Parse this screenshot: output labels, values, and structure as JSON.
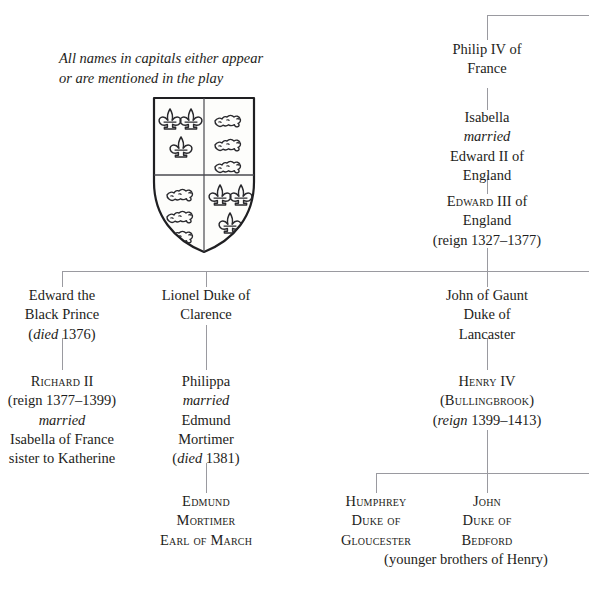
{
  "caption": {
    "line1": "All names in capitals either appear",
    "line2": "or are mentioned in the play"
  },
  "emblem": {
    "name": "royal-arms-shield",
    "description": "Quartered shield of the royal arms: fleurs-de-lis of France in quarters 1 and 4, lions passant guardant of England in quarters 2 and 3"
  },
  "tree": {
    "philip_iv": {
      "l1": "Philip IV of",
      "l2": "France"
    },
    "isabella": {
      "l1": "Isabella",
      "l2": "married",
      "l3": "Edward II of",
      "l4": "England"
    },
    "edward_iii": {
      "l1_caps": "Edward",
      "l1_rest": " III of",
      "l2": "England",
      "l3": "(reign 1327–1377)"
    },
    "black_prince": {
      "l1": "Edward the",
      "l2": "Black Prince",
      "l3_open": "(",
      "l3_it": "died",
      "l3_rest": " 1376)"
    },
    "richard_ii": {
      "l1_caps": "Richard",
      "l1_rest": " II",
      "l2": "(reign 1377–1399)",
      "l3": "married",
      "l4": "Isabella of France",
      "l5": "sister to Katherine"
    },
    "lionel": {
      "l1": "Lionel Duke of",
      "l2": "Clarence"
    },
    "philippa": {
      "l1": "Philippa",
      "l2": "married",
      "l3": "Edmund",
      "l4": "Mortimer",
      "l5_open": "(",
      "l5_it": "died",
      "l5_rest": " 1381)"
    },
    "edmund_mortimer": {
      "l1": "Edmund",
      "l2": "Mortimer",
      "l3": "Earl of March"
    },
    "john_of_gaunt": {
      "l1": "John of Gaunt",
      "l2": "Duke of",
      "l3": "Lancaster"
    },
    "henry_iv": {
      "l1_caps": "Henry",
      "l1_rest": " IV",
      "l2_open": "(",
      "l2_caps": "Bullingbrook",
      "l2_close": ")",
      "l3_open": "(",
      "l3_it": "reign",
      "l3_rest": " 1399–1413)"
    },
    "humphrey": {
      "l1": "Humphrey",
      "l2": "Duke of",
      "l3": "Gloucester"
    },
    "john_bedford": {
      "l1": "John",
      "l2": "Duke of",
      "l3": "Bedford"
    },
    "younger_brothers": {
      "l1": "(younger brothers of Henry)"
    }
  },
  "colors": {
    "ink": "#1d1d20",
    "rule": "#9a9aa0",
    "background": "#ffffff"
  }
}
